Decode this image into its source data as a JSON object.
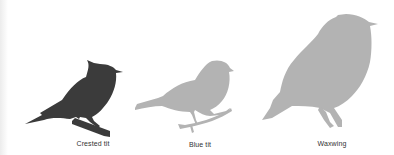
{
  "figure": {
    "birds": [
      {
        "name": "Crested tit",
        "color": "#3b3b3b",
        "label_x": 93,
        "label_y": 140
      },
      {
        "name": "Blue tit",
        "color": "#b3b3b3",
        "label_x": 200,
        "label_y": 141
      },
      {
        "name": "Waxwing",
        "color": "#b3b3b3",
        "label_x": 332,
        "label_y": 140
      }
    ]
  }
}
